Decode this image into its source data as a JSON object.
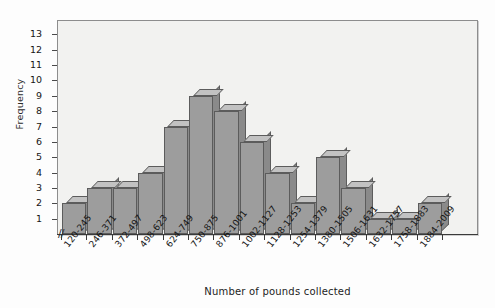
{
  "chart_data": {
    "type": "bar",
    "title": "",
    "xlabel": "Number of pounds collected",
    "ylabel": "Frequency",
    "categories": [
      "120-245",
      "246-371",
      "372-497",
      "498-623",
      "624-749",
      "750-875",
      "876-1001",
      "1002-1127",
      "1128-1253",
      "1254-1379",
      "1380-1505",
      "1506-1631",
      "1632-1757",
      "1758-1883",
      "1884-2009"
    ],
    "values": [
      2,
      3,
      3,
      4,
      7,
      9,
      8,
      6,
      4,
      2,
      5,
      3,
      1,
      1,
      2
    ],
    "ylim": [
      0,
      14
    ],
    "yticks": [
      1,
      2,
      3,
      4,
      5,
      6,
      7,
      8,
      9,
      10,
      11,
      12,
      13
    ],
    "ytick_labels": [
      "1",
      "2",
      "3",
      "4",
      "5",
      "6",
      "7",
      "8",
      "9",
      "10",
      "11",
      "12",
      "13"
    ],
    "grid": false,
    "legend": null,
    "axis_break": "//",
    "style": {
      "bar_front_color": "#9d9d9d",
      "bar_top_color": "#c2c2c2",
      "bar_side_color": "#8a8a8a",
      "bar_edge_color": "#5c5c5c",
      "plot_background": "#f2f2f0",
      "frame_color": "#8d8d8d",
      "text_color": "#151515"
    }
  }
}
